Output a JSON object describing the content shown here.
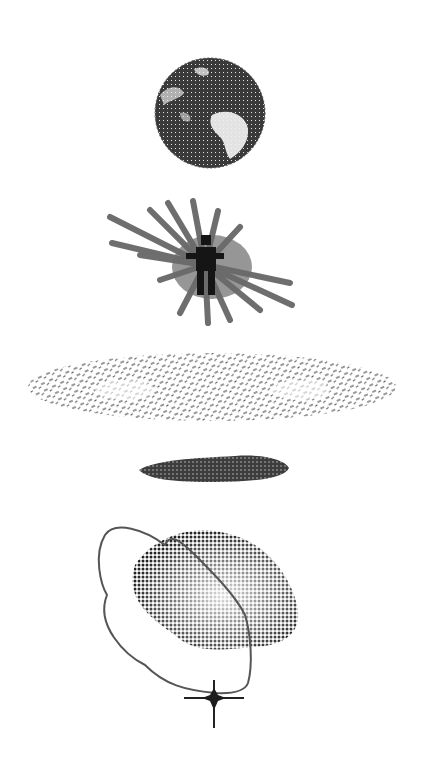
{
  "figure": {
    "background": "#ffffff",
    "ink": "#2e2e2e",
    "panels": [
      {
        "id": "earth",
        "label": "",
        "shape": "globe",
        "center": [
          210,
          113
        ],
        "radius": 55
      },
      {
        "id": "figure-burst",
        "label": "",
        "shape": "human figure with radiating streaks",
        "center": [
          205,
          265
        ]
      },
      {
        "id": "galaxy",
        "label": "",
        "shape": "flattened ellipse of scattered strokes",
        "center": [
          212,
          387
        ],
        "rx": 184,
        "ry": 34
      },
      {
        "id": "band",
        "label": "",
        "shape": "dense elongated cluster",
        "center": [
          213,
          468
        ],
        "rx": 75,
        "ry": 15
      },
      {
        "id": "halftone-blob",
        "label": "",
        "shape": "halftone cloud with looping curve",
        "center": [
          215,
          600
        ]
      },
      {
        "id": "star",
        "label": "",
        "shape": "four-pointed star",
        "center": [
          214,
          697
        ]
      }
    ]
  }
}
